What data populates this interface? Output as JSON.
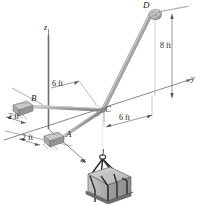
{
  "figure": {
    "type": "engineering-statics-3d-diagram",
    "background_color": "#ffffff",
    "line_color": "#4a4a4a",
    "member_color": "#9a9a9a",
    "crate_color": "#b9b9b9",
    "text_color": "#1b1b1b"
  },
  "axes": {
    "z_label": "z",
    "y_label": "y",
    "x_label": "x"
  },
  "points": {
    "a_label": "A",
    "b_label": "B",
    "c_label": "C",
    "d_label": "D"
  },
  "dimensions": {
    "vertical_8ft": "8 ft",
    "horizontal_6ft": "6 ft",
    "upper_6ft": "6 ft",
    "left_2ft": "2 ft",
    "lower_2ft": "2 ft"
  }
}
